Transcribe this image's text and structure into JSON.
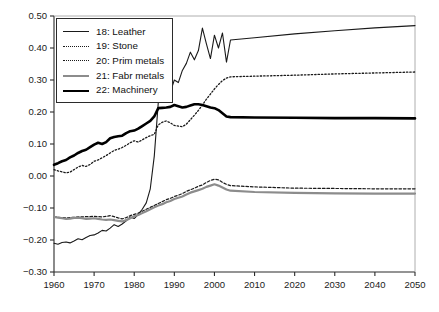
{
  "chart_data": {
    "type": "line",
    "title": "",
    "xlabel": "",
    "ylabel": "",
    "xlim": [
      1960,
      2050
    ],
    "ylim": [
      -0.3,
      0.5
    ],
    "xticks": [
      1960,
      1970,
      1980,
      1990,
      2000,
      2010,
      2020,
      2030,
      2040,
      2050
    ],
    "yticks": [
      "0.50",
      "0.40",
      "0.30",
      "0.20",
      "0.10",
      "0.00",
      "-0.10",
      "-0.20",
      "-0.30"
    ],
    "grid": false,
    "legend_position": "top-left",
    "series": [
      {
        "name": "18: Leather",
        "key": "leather",
        "color": "#1a1a1a",
        "style": "solid-thin",
        "width": 1.1,
        "x": [
          1960,
          1961,
          1962,
          1963,
          1964,
          1965,
          1966,
          1967,
          1968,
          1969,
          1970,
          1971,
          1972,
          1973,
          1974,
          1975,
          1976,
          1977,
          1978,
          1979,
          1980,
          1981,
          1982,
          1983,
          1984,
          1985,
          1986,
          1987,
          1988,
          1989,
          1990,
          1991,
          1992,
          1993,
          1994,
          1995,
          1996,
          1997,
          1998,
          1999,
          2000,
          2001,
          2002,
          2003,
          2004,
          2010,
          2020,
          2030,
          2040,
          2050
        ],
        "y": [
          -0.21,
          -0.213,
          -0.208,
          -0.206,
          -0.209,
          -0.203,
          -0.196,
          -0.199,
          -0.192,
          -0.186,
          -0.184,
          -0.178,
          -0.17,
          -0.172,
          -0.163,
          -0.152,
          -0.158,
          -0.15,
          -0.14,
          -0.128,
          -0.133,
          -0.12,
          -0.104,
          -0.084,
          -0.04,
          0.062,
          0.23,
          0.246,
          0.252,
          0.262,
          0.3,
          0.292,
          0.33,
          0.352,
          0.387,
          0.363,
          0.392,
          0.462,
          0.413,
          0.367,
          0.44,
          0.4,
          0.447,
          0.356,
          0.425,
          0.432,
          0.444,
          0.454,
          0.463,
          0.47
        ]
      },
      {
        "name": "19: Stone",
        "key": "stone",
        "color": "#1a1a1a",
        "style": "dotted",
        "width": 1.3,
        "x": [
          1960,
          1961,
          1962,
          1963,
          1964,
          1965,
          1966,
          1967,
          1968,
          1969,
          1970,
          1971,
          1972,
          1973,
          1974,
          1975,
          1976,
          1977,
          1978,
          1979,
          1980,
          1981,
          1982,
          1983,
          1984,
          1985,
          1986,
          1987,
          1988,
          1989,
          1990,
          1991,
          1992,
          1993,
          1994,
          1995,
          1996,
          1997,
          1998,
          1999,
          2000,
          2001,
          2002,
          2003,
          2004,
          2010,
          2020,
          2030,
          2040,
          2050
        ],
        "y": [
          0.02,
          0.016,
          0.013,
          0.01,
          0.012,
          0.02,
          0.028,
          0.033,
          0.03,
          0.036,
          0.046,
          0.05,
          0.057,
          0.064,
          0.072,
          0.08,
          0.084,
          0.089,
          0.096,
          0.104,
          0.11,
          0.106,
          0.113,
          0.12,
          0.126,
          0.13,
          0.16,
          0.168,
          0.172,
          0.166,
          0.158,
          0.156,
          0.154,
          0.162,
          0.176,
          0.19,
          0.205,
          0.222,
          0.24,
          0.256,
          0.272,
          0.286,
          0.298,
          0.306,
          0.31,
          0.312,
          0.315,
          0.319,
          0.322,
          0.325
        ]
      },
      {
        "name": "20: Prim metals",
        "key": "prim_metals",
        "color": "#1a1a1a",
        "style": "dashdot",
        "width": 1.2,
        "x": [
          1960,
          1961,
          1962,
          1963,
          1964,
          1965,
          1966,
          1967,
          1968,
          1969,
          1970,
          1971,
          1972,
          1973,
          1974,
          1975,
          1976,
          1977,
          1978,
          1979,
          1980,
          1981,
          1982,
          1983,
          1984,
          1985,
          1986,
          1987,
          1988,
          1989,
          1990,
          1991,
          1992,
          1993,
          1994,
          1995,
          1996,
          1997,
          1998,
          1999,
          2000,
          2001,
          2002,
          2003,
          2004,
          2010,
          2020,
          2030,
          2040,
          2050
        ],
        "y": [
          -0.128,
          -0.129,
          -0.13,
          -0.131,
          -0.13,
          -0.129,
          -0.128,
          -0.128,
          -0.127,
          -0.127,
          -0.126,
          -0.127,
          -0.128,
          -0.126,
          -0.124,
          -0.127,
          -0.131,
          -0.134,
          -0.13,
          -0.124,
          -0.12,
          -0.116,
          -0.11,
          -0.104,
          -0.098,
          -0.092,
          -0.086,
          -0.08,
          -0.074,
          -0.07,
          -0.064,
          -0.06,
          -0.055,
          -0.048,
          -0.043,
          -0.038,
          -0.032,
          -0.028,
          -0.02,
          -0.014,
          -0.01,
          -0.012,
          -0.02,
          -0.026,
          -0.03,
          -0.034,
          -0.038,
          -0.039,
          -0.04,
          -0.04
        ]
      },
      {
        "name": "21: Fabr metals",
        "key": "fabr_metals",
        "color": "#8c8c8c",
        "style": "solid-gray",
        "width": 2.2,
        "x": [
          1960,
          1961,
          1962,
          1963,
          1964,
          1965,
          1966,
          1967,
          1968,
          1969,
          1970,
          1971,
          1972,
          1973,
          1974,
          1975,
          1976,
          1977,
          1978,
          1979,
          1980,
          1981,
          1982,
          1983,
          1984,
          1985,
          1986,
          1987,
          1988,
          1989,
          1990,
          1991,
          1992,
          1993,
          1994,
          1995,
          1996,
          1997,
          1998,
          1999,
          2000,
          2001,
          2002,
          2003,
          2004,
          2010,
          2020,
          2030,
          2040,
          2050
        ],
        "y": [
          -0.128,
          -0.13,
          -0.132,
          -0.134,
          -0.133,
          -0.131,
          -0.13,
          -0.132,
          -0.134,
          -0.133,
          -0.132,
          -0.134,
          -0.136,
          -0.137,
          -0.136,
          -0.138,
          -0.14,
          -0.142,
          -0.138,
          -0.132,
          -0.126,
          -0.122,
          -0.116,
          -0.11,
          -0.104,
          -0.098,
          -0.092,
          -0.088,
          -0.082,
          -0.078,
          -0.072,
          -0.068,
          -0.064,
          -0.058,
          -0.052,
          -0.048,
          -0.044,
          -0.04,
          -0.034,
          -0.03,
          -0.026,
          -0.03,
          -0.036,
          -0.042,
          -0.046,
          -0.05,
          -0.053,
          -0.054,
          -0.055,
          -0.055
        ]
      },
      {
        "name": "22: Machinery",
        "key": "machinery",
        "color": "#000000",
        "style": "solid-bold",
        "width": 2.6,
        "x": [
          1960,
          1961,
          1962,
          1963,
          1964,
          1965,
          1966,
          1967,
          1968,
          1969,
          1970,
          1971,
          1972,
          1973,
          1974,
          1975,
          1976,
          1977,
          1978,
          1979,
          1980,
          1981,
          1982,
          1983,
          1984,
          1985,
          1986,
          1987,
          1988,
          1989,
          1990,
          1991,
          1992,
          1993,
          1994,
          1995,
          1996,
          1997,
          1998,
          1999,
          2000,
          2001,
          2002,
          2003,
          2004,
          2010,
          2020,
          2030,
          2040,
          2050
        ],
        "y": [
          0.035,
          0.04,
          0.046,
          0.05,
          0.058,
          0.064,
          0.072,
          0.078,
          0.082,
          0.09,
          0.098,
          0.104,
          0.1,
          0.106,
          0.118,
          0.122,
          0.124,
          0.126,
          0.134,
          0.14,
          0.142,
          0.148,
          0.156,
          0.164,
          0.172,
          0.186,
          0.212,
          0.213,
          0.214,
          0.216,
          0.222,
          0.218,
          0.214,
          0.216,
          0.22,
          0.224,
          0.224,
          0.222,
          0.218,
          0.214,
          0.212,
          0.206,
          0.196,
          0.186,
          0.184,
          0.183,
          0.182,
          0.181,
          0.181,
          0.18
        ]
      }
    ]
  },
  "legend": {
    "items": [
      {
        "label": "18: Leather",
        "style": "sw-solid-thin"
      },
      {
        "label": "19: Stone",
        "style": "sw-dotted"
      },
      {
        "label": "20: Prim metals",
        "style": "sw-dashdot"
      },
      {
        "label": "21: Fabr metals",
        "style": "sw-gray"
      },
      {
        "label": "22: Machinery",
        "style": "sw-bold"
      }
    ]
  },
  "colors": {
    "axis": "#2b2b2b",
    "text": "#1a1a1a",
    "gray_series": "#8c8c8c",
    "background": "#ffffff"
  }
}
